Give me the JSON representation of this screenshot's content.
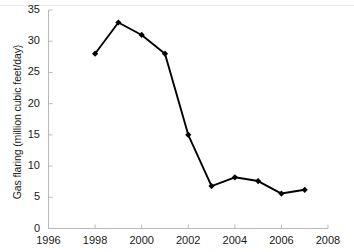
{
  "chart_data": {
    "type": "line",
    "title": "",
    "xlabel": "",
    "ylabel": "Gas flaring (million cubic feet/day)",
    "x": [
      1998,
      1999,
      2000,
      2001,
      2002,
      2003,
      2004,
      2005,
      2006,
      2007
    ],
    "values": [
      28,
      33,
      31,
      28,
      15,
      6.8,
      8.2,
      7.6,
      5.6,
      6.2
    ],
    "series": [
      {
        "name": "Gas flaring",
        "x": [
          1998,
          1999,
          2000,
          2001,
          2002,
          2003,
          2004,
          2005,
          2006,
          2007
        ],
        "values": [
          28,
          33,
          31,
          28,
          15,
          6.8,
          8.2,
          7.6,
          5.6,
          6.2
        ]
      }
    ],
    "xlim": [
      1996,
      2008
    ],
    "ylim": [
      0,
      35
    ],
    "xticks": [
      1996,
      1998,
      2000,
      2002,
      2004,
      2006,
      2008
    ],
    "yticks": [
      0,
      5,
      10,
      15,
      20,
      25,
      30,
      35
    ],
    "xtick_labels": [
      "1996",
      "1998",
      "2000",
      "2002",
      "2004",
      "2006",
      "2008"
    ],
    "ytick_labels": [
      "0",
      "5",
      "10",
      "15",
      "20",
      "25",
      "30",
      "35"
    ],
    "grid": false,
    "legend": null,
    "legend_position": "none",
    "marker": "diamond",
    "line_color": "#000000",
    "marker_color": "#000000",
    "axis_color": "#b9b9b9",
    "background_color": "#ffffff",
    "annotations": []
  }
}
